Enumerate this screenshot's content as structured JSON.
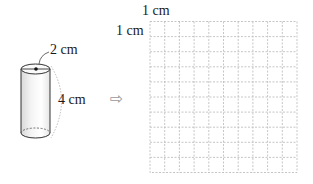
{
  "cylinder": {
    "diameter_label": "2 cm",
    "height_label": "4 cm",
    "diameter_cm": 2,
    "height_cm": 4
  },
  "arrow": {
    "icon": "outline-right-arrow-icon",
    "glyph": "⇨"
  },
  "grid": {
    "top_label": "1 cm",
    "left_label": "1 cm",
    "columns": 10,
    "rows": 10,
    "cell_size_cm": 1,
    "line_color": "#b8b8b8",
    "line_style": "dashed"
  }
}
